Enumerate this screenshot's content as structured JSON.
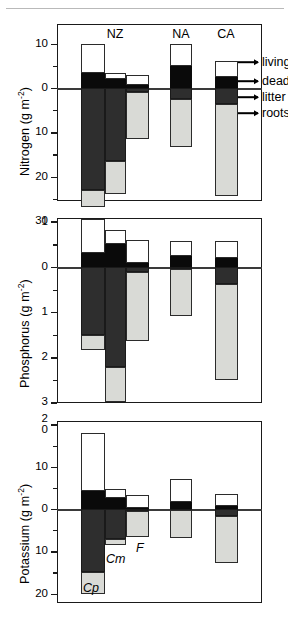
{
  "figure": {
    "groups": [
      {
        "id": "NZ",
        "label": "NZ"
      },
      {
        "id": "NA",
        "label": "NA"
      },
      {
        "id": "CA",
        "label": "CA"
      }
    ],
    "legend": {
      "items": [
        {
          "key": "living",
          "label": "living"
        },
        {
          "key": "dead",
          "label": "dead"
        },
        {
          "key": "litter",
          "label": "litter"
        },
        {
          "key": "roots",
          "label": "roots"
        }
      ]
    },
    "species_annotations": [
      {
        "key": "Cp",
        "label": "Cp"
      },
      {
        "key": "Cm",
        "label": "Cm"
      },
      {
        "key": "F",
        "label": "F"
      }
    ],
    "units": "g m",
    "units_exp": "-2"
  },
  "chart_data": [
    {
      "type": "bar",
      "id": "nitrogen",
      "title": "",
      "ylabel": "Nitrogen (g m-2)",
      "ylabel_text": "Nitrogen",
      "xlabel": "",
      "orientation": "vertical-diverging",
      "ylim": [
        -10,
        30
      ],
      "yticks": [
        -10,
        0,
        10,
        20,
        30
      ],
      "ytick_labels": [
        "10",
        "0",
        "10",
        "20",
        "30"
      ],
      "yminor": [
        -5,
        5,
        15,
        25
      ],
      "grid": false,
      "note": "Positive axis direction is downward (belowground); aboveground pools plotted above zero line.",
      "categories": [
        "NZ-Cp",
        "NZ-Cm",
        "NZ-F",
        "NA",
        "CA"
      ],
      "series": [
        {
          "name": "living",
          "values": [
            6.6,
            1.5,
            2.3,
            5.0,
            3.6
          ]
        },
        {
          "name": "dead",
          "values": [
            3.4,
            2.0,
            0.7,
            5.0,
            2.4
          ]
        },
        {
          "name": "litter",
          "values": [
            23.0,
            16.4,
            1.0,
            2.5,
            3.6
          ]
        },
        {
          "name": "roots",
          "values": [
            4.0,
            7.5,
            10.5,
            10.8,
            20.9
          ]
        }
      ]
    },
    {
      "type": "bar",
      "id": "phosphorus",
      "title": "",
      "ylabel": "Phosphorus (g m-2)",
      "ylabel_text": "Phosphorus",
      "xlabel": "",
      "orientation": "vertical-diverging",
      "ylim": [
        -1.1,
        3
      ],
      "yticks": [
        -1,
        0,
        1,
        2,
        3
      ],
      "ytick_labels": [
        "1",
        "0",
        "1",
        "2",
        "3"
      ],
      "yminor": [
        -0.5,
        0.5,
        1.5,
        2.5
      ],
      "grid": false,
      "categories": [
        "NZ-Cp",
        "NZ-Cm",
        "NZ-F",
        "NA",
        "CA"
      ],
      "series": [
        {
          "name": "living",
          "values": [
            0.76,
            0.33,
            0.52,
            0.33,
            0.38
          ]
        },
        {
          "name": "dead",
          "values": [
            0.3,
            0.5,
            0.08,
            0.24,
            0.2
          ]
        },
        {
          "name": "litter",
          "values": [
            1.5,
            2.22,
            0.1,
            0.05,
            0.38
          ]
        },
        {
          "name": "roots",
          "values": [
            0.35,
            0.78,
            1.55,
            1.03,
            2.12
          ]
        }
      ]
    },
    {
      "type": "bar",
      "id": "potassium",
      "title": "",
      "ylabel": "Potassium (g m-2)",
      "ylabel_text": "Potassium",
      "xlabel": "",
      "orientation": "vertical-diverging",
      "ylim": [
        -21,
        22
      ],
      "yticks": [
        -20,
        -10,
        0,
        10,
        20
      ],
      "ytick_labels": [
        "20",
        "10",
        "0",
        "10",
        "20"
      ],
      "yminor": [
        -15,
        -5,
        5,
        15
      ],
      "grid": false,
      "categories": [
        "NZ-Cp",
        "NZ-Cm",
        "NZ-F",
        "NA",
        "CA"
      ],
      "series": [
        {
          "name": "living",
          "values": [
            13.6,
            2.0,
            3.1,
            5.3,
            2.8
          ]
        },
        {
          "name": "dead",
          "values": [
            4.3,
            2.7,
            0.2,
            1.7,
            0.8
          ]
        },
        {
          "name": "litter",
          "values": [
            14.9,
            7.2,
            0.5,
            0.2,
            1.6
          ]
        },
        {
          "name": "roots",
          "values": [
            5.3,
            1.3,
            6.2,
            6.6,
            11.2
          ]
        }
      ]
    }
  ]
}
